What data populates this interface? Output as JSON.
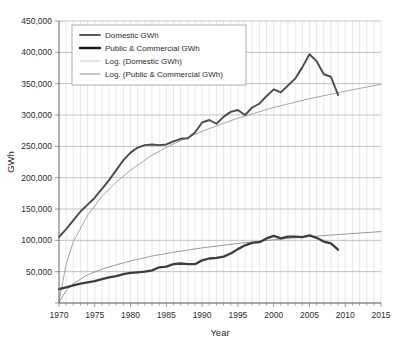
{
  "chart_data": {
    "type": "line",
    "title": "",
    "xlabel": "Year",
    "ylabel": "GWh",
    "xlim": [
      1970,
      2015
    ],
    "ylim": [
      0,
      450000
    ],
    "xticks": [
      1970,
      1975,
      1980,
      1985,
      1990,
      1995,
      2000,
      2005,
      2010,
      2015
    ],
    "yticks": [
      0,
      50000,
      100000,
      150000,
      200000,
      250000,
      300000,
      350000,
      400000,
      450000
    ],
    "ytick_labels": [
      "",
      "50,000",
      "100,000",
      "150,000",
      "200,000",
      "250,000",
      "300,000",
      "350,000",
      "400,000",
      "450,000"
    ],
    "grid": {
      "horizontal_major": true,
      "vertical_minor": true,
      "minor_step": 1
    },
    "legend": {
      "position": "top-left-inside",
      "entries": [
        {
          "label": "Domestic GWh",
          "color": "#595959",
          "width": 1.8,
          "style": "solid"
        },
        {
          "label": "Public & Commercial GWh",
          "color": "#1a1a1a",
          "width": 2.4,
          "style": "solid"
        },
        {
          "label": "Log. (Domestic GWh)",
          "color": "#c8c8c8",
          "width": 1.0,
          "style": "solid"
        },
        {
          "label": "Log. (Public & Commercial GWh)",
          "color": "#8c8c8c",
          "width": 1.0,
          "style": "solid"
        }
      ]
    },
    "series": [
      {
        "name": "Public & Commercial GWh",
        "color": "#4a4a4a",
        "width": 1.9,
        "x": [
          1970,
          1971,
          1972,
          1973,
          1974,
          1975,
          1976,
          1977,
          1978,
          1979,
          1980,
          1981,
          1982,
          1983,
          1984,
          1985,
          1986,
          1987,
          1988,
          1989,
          1990,
          1991,
          1992,
          1993,
          1994,
          1995,
          1996,
          1997,
          1998,
          1999,
          2000,
          2001,
          2002,
          2003,
          2004,
          2005,
          2006,
          2007,
          2008,
          2009
        ],
        "values": [
          105000,
          118000,
          132000,
          146000,
          157000,
          168000,
          182000,
          196000,
          212000,
          228000,
          240000,
          248000,
          252000,
          253000,
          252000,
          253000,
          258000,
          262000,
          263000,
          272000,
          288000,
          292000,
          286000,
          297000,
          305000,
          308000,
          300000,
          312000,
          318000,
          330000,
          341000,
          336000,
          347000,
          358000,
          376000,
          397000,
          386000,
          365000,
          361000,
          332000
        ]
      },
      {
        "name": "Domestic GWh",
        "color": "#3d3d3d",
        "width": 2.3,
        "x": [
          1970,
          1971,
          1972,
          1973,
          1974,
          1975,
          1976,
          1977,
          1978,
          1979,
          1980,
          1981,
          1982,
          1983,
          1984,
          1985,
          1986,
          1987,
          1988,
          1989,
          1990,
          1991,
          1992,
          1993,
          1994,
          1995,
          1996,
          1997,
          1998,
          1999,
          2000,
          2001,
          2002,
          2003,
          2004,
          2005,
          2006,
          2007,
          2008,
          2009
        ],
        "values": [
          22000,
          25000,
          28000,
          31000,
          33000,
          35000,
          38000,
          41000,
          43000,
          46000,
          48000,
          49000,
          50000,
          52000,
          57000,
          58000,
          62000,
          63000,
          62000,
          62000,
          68000,
          71000,
          72000,
          74000,
          79000,
          86000,
          92000,
          96000,
          97000,
          103000,
          107000,
          103000,
          106000,
          106000,
          105000,
          108000,
          104000,
          98000,
          95000,
          85000
        ]
      }
    ],
    "trendlines": [
      {
        "name": "Log. (Public & Commercial GWh)",
        "color": "#9a9a9a",
        "width": 0.9,
        "fit": "logarithmic",
        "x": [
          1970,
          1971,
          1972,
          1974,
          1976,
          1978,
          1980,
          1983,
          1986,
          1990,
          1995,
          2000,
          2005,
          2010,
          2015
        ],
        "values": [
          2000,
          62000,
          98000,
          140000,
          170000,
          193000,
          212000,
          236000,
          254000,
          274000,
          295000,
          312000,
          326000,
          338000,
          349000
        ]
      },
      {
        "name": "Log. (Domestic GWh)",
        "color": "#8f8f8f",
        "width": 0.9,
        "fit": "logarithmic",
        "x": [
          1970,
          1971,
          1972,
          1974,
          1976,
          1978,
          1980,
          1983,
          1986,
          1990,
          1995,
          2000,
          2005,
          2010,
          2015
        ],
        "values": [
          1000,
          20000,
          31000,
          45000,
          54000,
          61000,
          67000,
          75000,
          81000,
          88000,
          95000,
          101000,
          106000,
          110000,
          114000
        ]
      }
    ]
  }
}
